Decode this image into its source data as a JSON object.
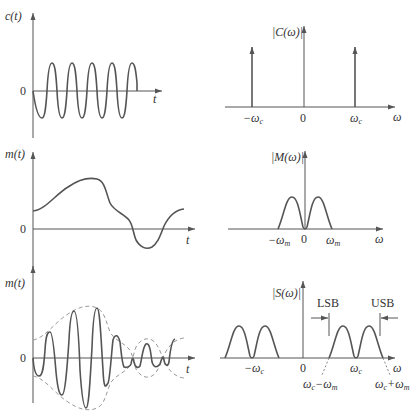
{
  "figure": {
    "panels": [
      {
        "id": "carrier-time",
        "ylabel": "c(t)",
        "zero": "0",
        "xlabel": "t",
        "shape": "sinusoid, 5 cycles, constant amplitude"
      },
      {
        "id": "carrier-spectrum",
        "ylabel": "|C(ω)|",
        "ticks": [
          "−ω",
          "0",
          "ω"
        ],
        "tick_subs": [
          "c",
          "",
          "c"
        ],
        "xlabel": "ω",
        "shape": "two impulses at ±ωc"
      },
      {
        "id": "message-time",
        "ylabel": "m(t)",
        "zero": "0",
        "xlabel": "t",
        "shape": "smooth lowpass waveform"
      },
      {
        "id": "message-spectrum",
        "ylabel": "|M(ω)|",
        "ticks": [
          "−ω",
          "0",
          "ω"
        ],
        "tick_subs": [
          "m",
          "",
          "m"
        ],
        "xlabel": "ω",
        "shape": "two bumps between −ωm and ωm"
      },
      {
        "id": "modulated-time",
        "ylabel": "m(t)",
        "zero": "0",
        "xlabel": "t",
        "shape": "carrier multiplied by message, dashed envelope ±m(t)"
      },
      {
        "id": "modulated-spectrum",
        "ylabel": "|S(ω)|",
        "ticks": [
          "−ω",
          "0",
          "ω"
        ],
        "tick_subs": [
          "c",
          "",
          "c"
        ],
        "xlabel": "ω",
        "band_labels": [
          "LSB",
          "USB"
        ],
        "edge_labels": [
          {
            "main": "ω",
            "sub1": "c",
            "mid": "−ω",
            "sub2": "m"
          },
          {
            "main": "ω",
            "sub1": "c",
            "mid": "+ω",
            "sub2": "m"
          }
        ],
        "shape": "spectrum shifted to ±ωc"
      }
    ]
  }
}
